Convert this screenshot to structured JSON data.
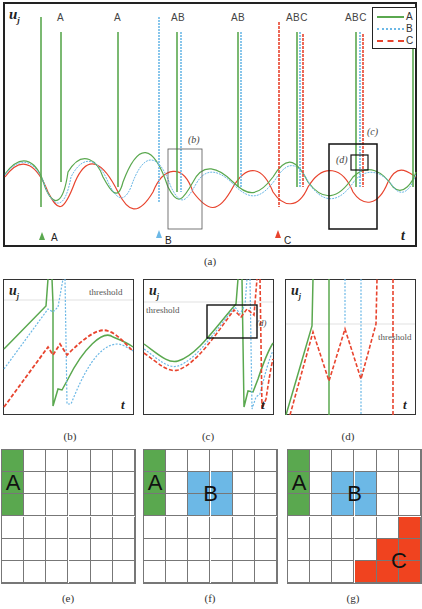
{
  "colors": {
    "A": "#5aa84f",
    "B": "#6cb8e6",
    "C": "#e8442e",
    "grid_line": "#777777",
    "frame": "#222222"
  },
  "panel_a": {
    "caption": "(a)",
    "ylabel": "u_j",
    "ylabel_main": "u",
    "ylabel_sub": "j",
    "xlabel": "t",
    "spike_labels": [
      "A",
      "A",
      "A B",
      "A B",
      "A B C",
      "A B C"
    ],
    "stimulus_markers": [
      {
        "label": "A",
        "color": "#5aa84f"
      },
      {
        "label": "B",
        "color": "#6cb8e6"
      },
      {
        "label": "C",
        "color": "#e8442e"
      }
    ],
    "zoom_boxes": [
      {
        "label": "(b)"
      },
      {
        "label": "(c)"
      },
      {
        "label": "(d)"
      }
    ],
    "legend": [
      {
        "label": "A",
        "style": "solid",
        "color": "#5aa84f"
      },
      {
        "label": "B",
        "style": "dotted",
        "color": "#6cb8e6"
      },
      {
        "label": "C",
        "style": "dashed",
        "color": "#e8442e"
      }
    ]
  },
  "panel_b": {
    "caption": "(b)",
    "ylabel_main": "u",
    "ylabel_sub": "j",
    "xlabel": "t",
    "threshold_label": "threshold"
  },
  "panel_c": {
    "caption": "(c)",
    "ylabel_main": "u",
    "ylabel_sub": "j",
    "xlabel": "t",
    "threshold_label": "threshold",
    "inset_label": "(d)"
  },
  "panel_d": {
    "caption": "(d)",
    "ylabel_main": "u",
    "ylabel_sub": "j",
    "xlabel": "t",
    "threshold_label": "threshold"
  },
  "grids": [
    {
      "caption": "(e)",
      "rows": 6,
      "cols": 6,
      "regions": [
        {
          "label": "A",
          "color": "#5aa84f",
          "cells": [
            [
              0,
              0
            ],
            [
              1,
              0
            ],
            [
              2,
              0
            ]
          ],
          "label_cell": [
            1,
            0
          ]
        }
      ]
    },
    {
      "caption": "(f)",
      "rows": 6,
      "cols": 6,
      "regions": [
        {
          "label": "A",
          "color": "#5aa84f",
          "cells": [
            [
              0,
              0
            ],
            [
              1,
              0
            ],
            [
              2,
              0
            ]
          ],
          "label_cell": [
            1,
            0
          ]
        },
        {
          "label": "B",
          "color": "#6cb8e6",
          "cells": [
            [
              1,
              2
            ],
            [
              1,
              3
            ],
            [
              2,
              2
            ],
            [
              2,
              3
            ]
          ],
          "label_cell": [
            1.5,
            2.5
          ]
        }
      ]
    },
    {
      "caption": "(g)",
      "rows": 6,
      "cols": 6,
      "regions": [
        {
          "label": "A",
          "color": "#5aa84f",
          "cells": [
            [
              0,
              0
            ],
            [
              1,
              0
            ],
            [
              2,
              0
            ]
          ],
          "label_cell": [
            1,
            0
          ]
        },
        {
          "label": "B",
          "color": "#6cb8e6",
          "cells": [
            [
              1,
              2
            ],
            [
              1,
              3
            ],
            [
              2,
              2
            ],
            [
              2,
              3
            ]
          ],
          "label_cell": [
            1.5,
            2.5
          ]
        },
        {
          "label": "C",
          "color": "#f0431f",
          "cells": [
            [
              3,
              5
            ],
            [
              4,
              4
            ],
            [
              4,
              5
            ],
            [
              5,
              3
            ],
            [
              5,
              4
            ],
            [
              5,
              5
            ]
          ],
          "label_cell": [
            4.5,
            4.5
          ]
        }
      ]
    }
  ]
}
